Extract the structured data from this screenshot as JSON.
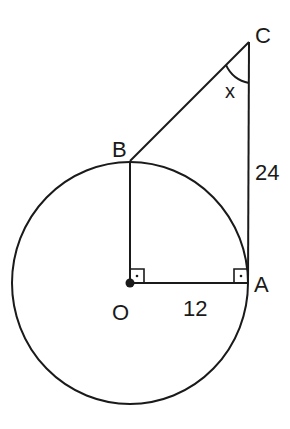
{
  "diagram": {
    "type": "geometry",
    "points": {
      "O": {
        "label": "O"
      },
      "A": {
        "label": "A"
      },
      "B": {
        "label": "B"
      },
      "C": {
        "label": "C"
      }
    },
    "measurements": {
      "OA": "12",
      "AC": "24"
    },
    "angle_label": "x",
    "right_angles": [
      "BOA",
      "OAC"
    ],
    "stroke_color": "#1a1a1a",
    "background": "#ffffff"
  }
}
